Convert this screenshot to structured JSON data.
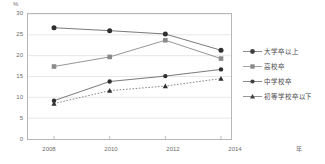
{
  "chart_data": {
    "type": "line",
    "title": "",
    "xlabel": "年",
    "ylabel": "%",
    "x": [
      2008,
      2010,
      2012,
      2014
    ],
    "categories": [
      "2008",
      "2010",
      "2012",
      "2014"
    ],
    "ylim": [
      0,
      30
    ],
    "yticks": [
      0,
      5,
      10,
      15,
      20,
      25,
      30
    ],
    "ytick_labels": [
      "0",
      "5",
      "10",
      "15",
      "20",
      "25",
      "30"
    ],
    "grid": true,
    "legend_position": "right",
    "series": [
      {
        "name": "大学卒以上",
        "marker": "filled-circle",
        "line_style": "solid",
        "color": "#6b6a6c",
        "values": [
          26.7,
          26.0,
          25.2,
          21.3
        ]
      },
      {
        "name": "高校卒",
        "marker": "filled-square",
        "line_style": "solid",
        "color": "#8a8a8c",
        "values": [
          17.4,
          19.7,
          23.7,
          19.3
        ]
      },
      {
        "name": "中学校卒",
        "marker": "filled-circle-small",
        "line_style": "solid",
        "color": "#6b6a6c",
        "values": [
          9.2,
          13.8,
          15.1,
          16.7
        ]
      },
      {
        "name": "初等学校卒以下",
        "marker": "filled-triangle",
        "line_style": "dotted",
        "color": "#7a797b",
        "values": [
          8.5,
          11.6,
          12.7,
          14.5
        ]
      }
    ]
  },
  "axis": {
    "unit_y": "%",
    "unit_x": "年"
  },
  "colors": {
    "frame": "#b9b7b5",
    "grid": "#e4e2e0",
    "text": "#6d6c6e",
    "series_dark": "#6b6a6c",
    "series_square": "#8a8a8c"
  }
}
